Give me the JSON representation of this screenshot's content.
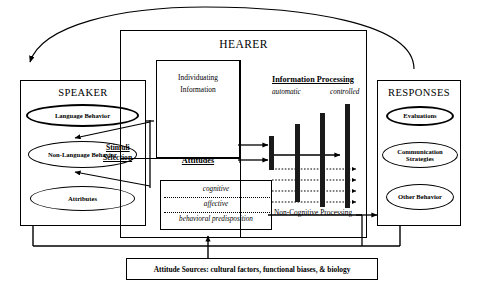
{
  "diagram": {
    "title_speaker": "SPEAKER",
    "title_hearer": "HEARER",
    "title_responses": "RESPONSES",
    "speaker_nodes": [
      {
        "label": "Language Behavior"
      },
      {
        "label": "Non-Language Behavior"
      },
      {
        "label": "Attributes"
      }
    ],
    "response_nodes": [
      {
        "label": "Evaluations"
      },
      {
        "label": "Communication Strategies"
      },
      {
        "label": "Other Behavior"
      }
    ],
    "hearer": {
      "individuating_information": "Individuating\nInformation",
      "individuating_line1": "Individuating",
      "individuating_line2": "Information",
      "attitudes_label": "Attitudes",
      "attitude_components": [
        {
          "label": "cognitive"
        },
        {
          "label": "affective"
        },
        {
          "label": "behavioral predisposition"
        }
      ]
    },
    "information_processing": {
      "heading": "Information Processing",
      "left_label": "automatic",
      "right_label": "controlled",
      "bar_heights": [
        30,
        46,
        62,
        78
      ],
      "bar_count": 4,
      "dotted_line_count": 4
    },
    "stimuli_selection": {
      "line1": "Stimuli",
      "line2": "Selection"
    },
    "non_cognitive_processing": "Non-Cognitive Processing",
    "attitude_sources": "Attitude Sources: cultural factors, functional biases, & biology",
    "colors": {
      "stroke": "#000000",
      "bar_fill": "#1a1a1a",
      "background": "#ffffff"
    }
  }
}
